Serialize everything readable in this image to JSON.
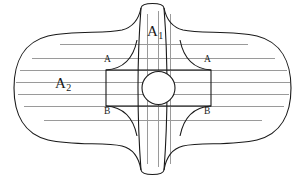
{
  "figure": {
    "width": 303,
    "height": 179,
    "background_color": "#ffffff",
    "outline_color": "#1a1a1a",
    "streamline_color": "#9a9a9a",
    "labels": {
      "vertical_channel": {
        "base": "A",
        "subscript": "1",
        "x": 149,
        "y": 30
      },
      "horizontal_channel": {
        "base": "A",
        "subscript": "2",
        "x": 58,
        "y": 82
      },
      "corner_top_left": {
        "text": "A",
        "x": 104,
        "y": 60
      },
      "corner_top_right": {
        "text": "A",
        "x": 204,
        "y": 60
      },
      "corner_bottom_left": {
        "text": "B",
        "x": 104,
        "y": 107
      },
      "corner_bottom_right": {
        "text": "B",
        "x": 204,
        "y": 107
      }
    },
    "geometry": {
      "rect": {
        "x": 106,
        "y": 70,
        "width": 105,
        "height": 36
      },
      "circle": {
        "cx": 158.5,
        "cy": 88,
        "r": 16.5
      },
      "vertical_channel": {
        "left": 140,
        "right": 177,
        "top": 8,
        "bottom": 170
      },
      "horizontal_extent": {
        "left": 14,
        "right": 291
      }
    },
    "streamlines": {
      "horizontal_y": [
        44,
        58,
        70,
        82,
        94,
        106,
        120
      ],
      "vertical_x": [
        147,
        158.5,
        170
      ]
    }
  }
}
